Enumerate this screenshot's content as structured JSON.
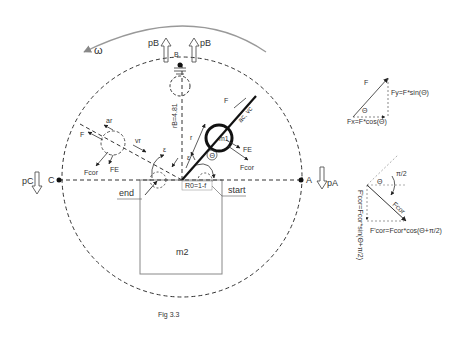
{
  "figure": {
    "caption": "Fig 3.3",
    "points": {
      "A": "A",
      "B": "B",
      "C": "C"
    },
    "pressures": {
      "pA": "pA",
      "pB": "pB",
      "pC": "pC"
    },
    "omega": "ω",
    "radius_label": "rB=4.81",
    "r0_label": "R0=1-f",
    "mass1": "m1",
    "mass2": "m2",
    "start": "start",
    "end": "end",
    "theta": "Θ",
    "r_label": "r",
    "epsilon": "ε",
    "vr_label": "vr",
    "ar_label": "ar",
    "ac_vc_label": "ac, vc",
    "forces": {
      "F": "F",
      "Fe": "FE",
      "Fcor": "Fcor"
    }
  },
  "inset_top": {
    "F": "F",
    "Fy": "Fy=F*sin(Θ)",
    "Fx": "Fx=F*cos(Θ)",
    "theta": "Θ"
  },
  "inset_bottom": {
    "theta": "Θ",
    "pi2": "π/2",
    "Fcor": "Fcor",
    "Fcor_x": "F'cor=Fcor*cos(Θ+π/2)",
    "Fcor_y": "F'cor=Fcor*sin(Θ+π/2)"
  }
}
